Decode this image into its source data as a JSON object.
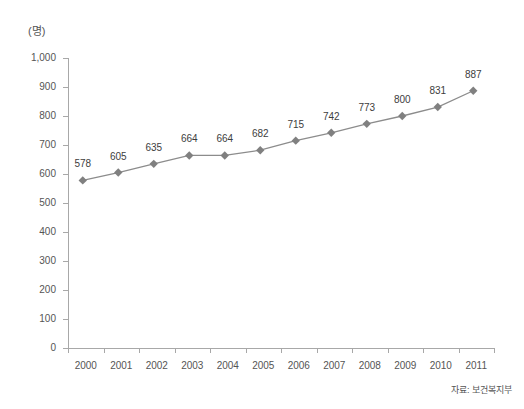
{
  "chart_data": {
    "type": "line",
    "title": "",
    "subtitle": "",
    "xlabel": "",
    "ylabel": "",
    "unit_label": "(명)",
    "categories": [
      "2000",
      "2001",
      "2002",
      "2003",
      "2004",
      "2005",
      "2006",
      "2007",
      "2008",
      "2009",
      "2010",
      "2011"
    ],
    "values": [
      578,
      605,
      635,
      664,
      664,
      682,
      715,
      742,
      773,
      800,
      831,
      887
    ],
    "point_labels": [
      "578",
      "605",
      "635",
      "664",
      "664",
      "682",
      "715",
      "742",
      "773",
      "800",
      "831",
      "887"
    ],
    "ylim": [
      0,
      1000
    ],
    "ytick_values": [
      0,
      100,
      200,
      300,
      400,
      500,
      600,
      700,
      800,
      900,
      1000
    ],
    "ytick_labels": [
      "0",
      "100",
      "200",
      "300",
      "400",
      "500",
      "600",
      "700",
      "800",
      "900",
      "1,000"
    ],
    "grid": false,
    "legend": null,
    "series": [
      {
        "name": "",
        "values": [
          578,
          605,
          635,
          664,
          664,
          682,
          715,
          742,
          773,
          800,
          831,
          887
        ],
        "color": "#8c8c8c",
        "marker": "diamond"
      }
    ],
    "colors": {
      "line": "#8c8c8c",
      "marker": "#808080",
      "axis": "#a8a8a8",
      "text": "#555555",
      "label_text": "#3d3d3d",
      "background": "#ffffff"
    }
  },
  "source": {
    "note": "자료: 보건복지부"
  }
}
